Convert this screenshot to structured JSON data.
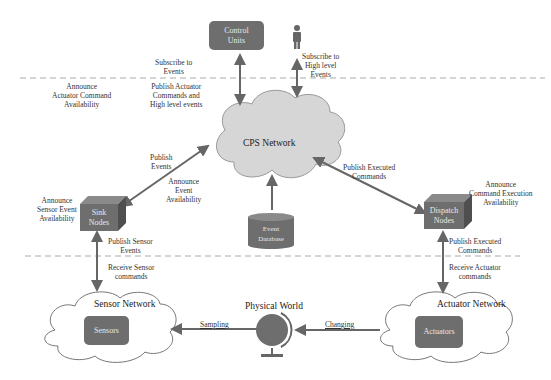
{
  "nodes": {
    "control_units": "Control Units",
    "control_units_l1": "Control",
    "control_units_l2": "Units",
    "cps_network": "CPS Network",
    "event_database_l1": "Event",
    "event_database_l2": "Database",
    "sink_nodes_l1": "Sink",
    "sink_nodes_l2": "Nodes",
    "dispatch_nodes_l1": "Dispatch",
    "dispatch_nodes_l2": "Nodes",
    "sensor_network": "Sensor Network",
    "sensors": "Sensors",
    "actuator_network": "Actuator Network",
    "actuators": "Actuators",
    "physical_world": "Physical World"
  },
  "labels": {
    "announce_actuator": [
      "Announce",
      "Actuator Command",
      "Availability"
    ],
    "subscribe_events": [
      "Subscribe to",
      "Events"
    ],
    "publish_actuator": [
      "Publish Actuator",
      "Commands and",
      "High level events"
    ],
    "subscribe_high": [
      "Subscribe to",
      "High level",
      "Events"
    ],
    "publish_events": [
      "Publish",
      "Events"
    ],
    "announce_event": [
      "Announce",
      "Event",
      "Availability"
    ],
    "announce_sensor": [
      "Announce",
      "Sensor Event",
      "Availability"
    ],
    "publish_executed_top": [
      "Publish Executed",
      "Commands"
    ],
    "announce_command": [
      "Announce",
      "Command Execution",
      "Availability"
    ],
    "publish_sensor": [
      "Publish Sensor",
      "Events"
    ],
    "receive_sensor": [
      "Receive Sensor",
      "commands"
    ],
    "publish_executed_bottom": [
      "Publish Executed",
      "Commands"
    ],
    "receive_actuator": [
      "Receive Actuator",
      "commands"
    ],
    "sampling": "Sampling",
    "changing": "Changing"
  },
  "icons": {
    "user": "person-icon",
    "globe": "globe-icon"
  },
  "colors": {
    "node_fill": "#6e6e6e",
    "cloud_fill": "#d6d6d6",
    "arrow": "#666666",
    "dashed_line": "#aaaaaa"
  }
}
